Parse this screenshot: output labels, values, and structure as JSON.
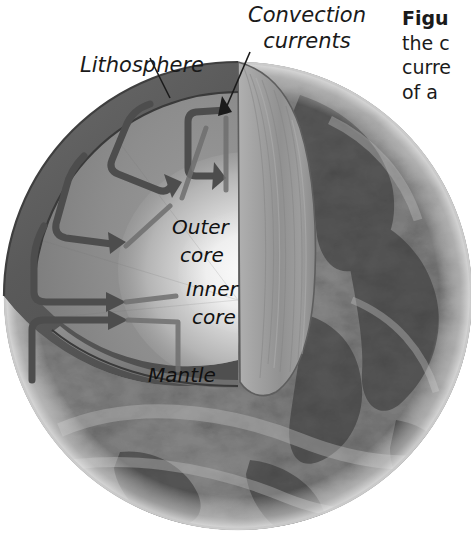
{
  "figure": {
    "alt_title": "Cutaway diagram of Earth's interior showing convection currents",
    "labels": {
      "convection_line1": "Convection",
      "convection_line2": "currents",
      "lithosphere": "Lithosphere",
      "outer_core_line1": "Outer",
      "outer_core_line2": "core",
      "inner_core_line1": "Inner",
      "inner_core_line2": "core",
      "mantle": "Mantle"
    },
    "caption": {
      "line1_strong": "Figu",
      "line2": "the c",
      "line3": "curre",
      "line4": "of a "
    },
    "colors": {
      "background": "#ffffff",
      "lithosphere_band": "#5e5e5e",
      "mantle_fill": "#8e8e8e",
      "mantle_fill_dark": "#7b7b7b",
      "cut_face": "#9a9a9a",
      "outer_core": "#c9c9c9",
      "inner_core": "#f0f0f0",
      "earth_surface": "#4a4a4a",
      "arrow_stroke": "#4d4d4d",
      "outline": "#3a3a3a",
      "text": "#1a1a1a"
    }
  }
}
